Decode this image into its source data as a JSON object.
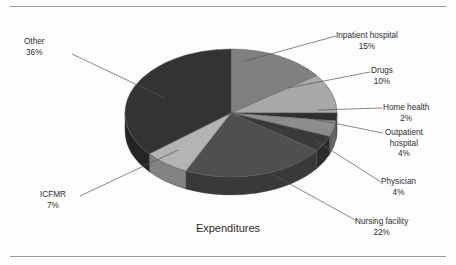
{
  "chart_data": {
    "type": "pie",
    "title": "Expenditures",
    "xlabel": "",
    "ylabel": "",
    "legend_position": "none",
    "grid": false,
    "style": "3d-pie",
    "categories": [
      "Inpatient hospital",
      "Drugs",
      "Home health",
      "Outpatient hospital",
      "Physician",
      "Nursing facility",
      "ICFMR",
      "Other"
    ],
    "values": [
      15,
      10,
      2,
      4,
      4,
      22,
      7,
      36
    ],
    "unit": "%",
    "colors": [
      "#808080",
      "#a8a8a8",
      "#2f2f2f",
      "#8d8d8d",
      "#3a3a3a",
      "#4f4f4f",
      "#b4b4b4",
      "#333333"
    ],
    "slices": [
      {
        "label": "Inpatient hospital",
        "value": 15,
        "value_text": "15%",
        "color": "#808080"
      },
      {
        "label": "Drugs",
        "value": 10,
        "value_text": "10%",
        "color": "#a8a8a8"
      },
      {
        "label": "Home health",
        "value": 2,
        "value_text": "2%",
        "color": "#2f2f2f"
      },
      {
        "label": "Outpatient hospital",
        "value": 4,
        "value_text": "4%",
        "color": "#8d8d8d"
      },
      {
        "label": "Physician",
        "value": 4,
        "value_text": "4%",
        "color": "#3a3a3a"
      },
      {
        "label": "Nursing facility",
        "value": 22,
        "value_text": "22%",
        "color": "#4f4f4f"
      },
      {
        "label": "ICFMR",
        "value": 7,
        "value_text": "7%",
        "color": "#b4b4b4"
      },
      {
        "label": "Other",
        "value": 36,
        "value_text": "36%",
        "color": "#333333"
      }
    ]
  },
  "labels": {
    "inpatient": {
      "name": "Inpatient hospital",
      "pct": "15%"
    },
    "drugs": {
      "name": "Drugs",
      "pct": "10%"
    },
    "home_health": {
      "name": "Home health",
      "pct": "2%"
    },
    "outpatient": {
      "name": "Outpatient",
      "name2": "hospital",
      "pct": "4%"
    },
    "physician": {
      "name": "Physician",
      "pct": "4%"
    },
    "nursing": {
      "name": "Nursing facility",
      "pct": "22%"
    },
    "icfmr": {
      "name": "ICFMR",
      "pct": "7%"
    },
    "other": {
      "name": "Other",
      "pct": "36%"
    }
  },
  "title": "Expenditures"
}
